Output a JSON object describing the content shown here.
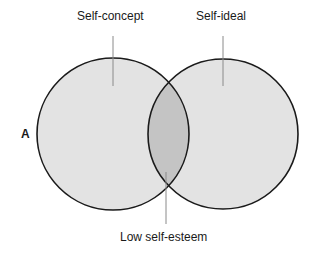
{
  "diagram": {
    "panel_letter": "A",
    "labels": {
      "left_circle": "Self-concept",
      "right_circle": "Self-ideal",
      "overlap": "Low self-esteem"
    },
    "colors": {
      "circle_fill": "#e3e3e3",
      "overlap_fill": "#c4c4c4",
      "stroke": "#1a1a1a",
      "leader_line": "#8a8a8a"
    }
  }
}
